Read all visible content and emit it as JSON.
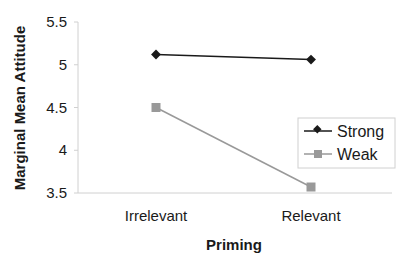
{
  "chart_data": {
    "type": "line",
    "title": "",
    "xlabel": "Priming",
    "ylabel": "Marginal Mean Attitude",
    "categories": [
      "Irrelevant",
      "Relevant"
    ],
    "ylim": [
      3.5,
      5.5
    ],
    "yticks": [
      "3.5",
      "4",
      "4.5",
      "5",
      "5.5"
    ],
    "grid": false,
    "legend_position": "right-inside",
    "series": [
      {
        "name": "Strong",
        "values": [
          5.12,
          5.06
        ],
        "color": "#1a1a1a",
        "marker": "diamond"
      },
      {
        "name": "Weak",
        "values": [
          4.5,
          3.57
        ],
        "color": "#999999",
        "marker": "square"
      }
    ]
  },
  "axes": {
    "xlabel": "Priming",
    "ylabel": "Marginal Mean Attitude",
    "yticks": [
      "3.5",
      "4",
      "4.5",
      "5",
      "5.5"
    ],
    "categories": [
      "Irrelevant",
      "Relevant"
    ]
  },
  "legend": {
    "items": [
      {
        "label": "Strong"
      },
      {
        "label": "Weak"
      }
    ]
  }
}
